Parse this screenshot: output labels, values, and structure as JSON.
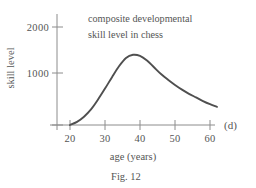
{
  "figure": {
    "caption": "Fig. 12",
    "panel_label": "(d)"
  },
  "chart_data": {
    "type": "line",
    "title": "",
    "annotation_line1": "composite developmental",
    "annotation_line2": "skill level in chess",
    "xlabel": "age  (years)",
    "ylabel": "skill level",
    "xlim": [
      18,
      63
    ],
    "ylim": [
      0,
      2300
    ],
    "grid": false,
    "legend": "none",
    "xticks": [
      20,
      30,
      40,
      50,
      60
    ],
    "xtick_labels": [
      "20",
      "30",
      "40",
      "50",
      "60"
    ],
    "yticks": [
      1000,
      2000
    ],
    "ytick_labels": [
      "1000",
      "2000"
    ],
    "series": [
      {
        "name": "composite developmental skill level in chess",
        "color": "#4f4f4f",
        "x": [
          20,
          22,
          24,
          26,
          28,
          30,
          32,
          34,
          36,
          38,
          40,
          42,
          44,
          46,
          48,
          50,
          52,
          54,
          56,
          58,
          60,
          62
        ],
        "values": [
          0,
          60,
          160,
          300,
          490,
          700,
          920,
          1130,
          1290,
          1350,
          1330,
          1240,
          1110,
          980,
          870,
          770,
          680,
          600,
          530,
          460,
          400,
          350
        ]
      }
    ],
    "peak": {
      "x": 38,
      "y": 1350
    },
    "colors": {
      "curve": "#4f4f4f",
      "axis": "#8c8c8c",
      "text": "#555555",
      "background": "#ffffff"
    }
  }
}
